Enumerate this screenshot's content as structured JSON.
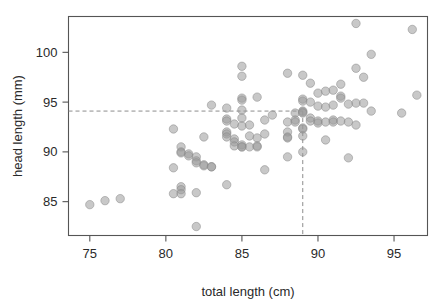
{
  "chart_data": {
    "type": "scatter",
    "title": "",
    "xlabel": "total length (cm)",
    "ylabel": "head length (mm)",
    "xlim": [
      73.6,
      97.2
    ],
    "ylim": [
      81.6,
      103.6
    ],
    "xticks": [
      75,
      80,
      85,
      90,
      95
    ],
    "xtick_labels": [
      "75",
      "80",
      "85",
      "90",
      "95"
    ],
    "yticks": [
      85,
      90,
      95,
      100
    ],
    "ytick_labels": [
      "85",
      "90",
      "95",
      "100"
    ],
    "grid": false,
    "legend": null,
    "annotations": [
      {
        "name": "horizontal-guide",
        "type": "hline",
        "y": 94.1,
        "style": "dashed",
        "color": "#8c8c8c"
      },
      {
        "name": "vertical-guide",
        "type": "vline",
        "x": 89.0,
        "y_end": 94.1,
        "style": "dashed",
        "color": "#8c8c8c"
      }
    ],
    "marker": {
      "shape": "circle",
      "radius_px": 4.2,
      "fill": "#9a9a9a",
      "fill_opacity": 0.55,
      "stroke": "#8a8a8a"
    },
    "n_points": 104,
    "points": [
      [
        75.0,
        84.7
      ],
      [
        76.0,
        85.1
      ],
      [
        77.0,
        85.3
      ],
      [
        80.5,
        92.3
      ],
      [
        80.5,
        85.8
      ],
      [
        80.5,
        88.4
      ],
      [
        81.0,
        90.5
      ],
      [
        81.0,
        90.0
      ],
      [
        81.0,
        89.9
      ],
      [
        81.0,
        86.5
      ],
      [
        81.0,
        86.2
      ],
      [
        81.0,
        85.8
      ],
      [
        81.5,
        89.8
      ],
      [
        81.5,
        89.6
      ],
      [
        82.0,
        89.5
      ],
      [
        82.0,
        89.1
      ],
      [
        82.0,
        88.9
      ],
      [
        82.0,
        85.9
      ],
      [
        82.0,
        82.5
      ],
      [
        82.5,
        91.5
      ],
      [
        82.5,
        88.7
      ],
      [
        82.5,
        88.6
      ],
      [
        83.0,
        94.7
      ],
      [
        83.0,
        88.5
      ],
      [
        83.0,
        88.5
      ],
      [
        84.0,
        94.4
      ],
      [
        84.0,
        93.3
      ],
      [
        84.0,
        93.1
      ],
      [
        84.0,
        92.0
      ],
      [
        84.0,
        91.8
      ],
      [
        84.0,
        91.5
      ],
      [
        84.0,
        86.7
      ],
      [
        84.5,
        92.8
      ],
      [
        84.5,
        91.3
      ],
      [
        84.5,
        91.0
      ],
      [
        84.5,
        90.6
      ],
      [
        85.0,
        98.6
      ],
      [
        85.0,
        97.6
      ],
      [
        85.0,
        95.4
      ],
      [
        85.0,
        95.2
      ],
      [
        85.0,
        94.2
      ],
      [
        85.0,
        93.4
      ],
      [
        85.0,
        92.6
      ],
      [
        85.0,
        90.7
      ],
      [
        85.0,
        90.5
      ],
      [
        85.0,
        90.5
      ],
      [
        85.5,
        92.7
      ],
      [
        85.5,
        91.6
      ],
      [
        85.5,
        90.5
      ],
      [
        86.0,
        95.5
      ],
      [
        86.0,
        91.4
      ],
      [
        86.0,
        90.6
      ],
      [
        86.0,
        90.5
      ],
      [
        86.5,
        93.2
      ],
      [
        86.5,
        91.8
      ],
      [
        86.5,
        88.2
      ],
      [
        87.0,
        93.7
      ],
      [
        88.0,
        97.9
      ],
      [
        88.0,
        93.0
      ],
      [
        88.0,
        92.0
      ],
      [
        88.0,
        91.5
      ],
      [
        88.0,
        91.4
      ],
      [
        88.0,
        89.5
      ],
      [
        88.5,
        93.9
      ],
      [
        88.5,
        93.2
      ],
      [
        88.5,
        93.0
      ],
      [
        89.0,
        97.7
      ],
      [
        89.0,
        95.3
      ],
      [
        89.0,
        95.1
      ],
      [
        89.0,
        94.1
      ],
      [
        89.0,
        94.0
      ],
      [
        89.0,
        93.9
      ],
      [
        89.0,
        92.4
      ],
      [
        89.0,
        92.3
      ],
      [
        89.0,
        91.6
      ],
      [
        89.0,
        90.0
      ],
      [
        89.5,
        96.9
      ],
      [
        89.5,
        95.0
      ],
      [
        89.5,
        93.4
      ],
      [
        89.5,
        93.1
      ],
      [
        90.0,
        95.9
      ],
      [
        90.0,
        94.6
      ],
      [
        90.0,
        93.1
      ],
      [
        90.0,
        92.9
      ],
      [
        90.5,
        96.1
      ],
      [
        90.5,
        94.5
      ],
      [
        90.5,
        93.0
      ],
      [
        90.5,
        91.2
      ],
      [
        91.0,
        96.2
      ],
      [
        91.0,
        94.7
      ],
      [
        91.0,
        93.2
      ],
      [
        91.0,
        93.0
      ],
      [
        91.5,
        96.8
      ],
      [
        91.5,
        95.6
      ],
      [
        91.5,
        95.4
      ],
      [
        91.5,
        93.1
      ],
      [
        92.0,
        94.8
      ],
      [
        92.0,
        93.0
      ],
      [
        92.0,
        89.4
      ],
      [
        92.5,
        102.9
      ],
      [
        92.5,
        98.4
      ],
      [
        92.5,
        94.9
      ],
      [
        92.5,
        92.7
      ],
      [
        93.0,
        97.5
      ],
      [
        93.0,
        94.9
      ],
      [
        93.5,
        99.8
      ],
      [
        93.5,
        94.1
      ],
      [
        95.5,
        93.9
      ],
      [
        96.2,
        102.3
      ],
      [
        96.5,
        95.7
      ]
    ]
  },
  "axes": {
    "x_axis_name": "x-axis",
    "y_axis_name": "y-axis"
  }
}
